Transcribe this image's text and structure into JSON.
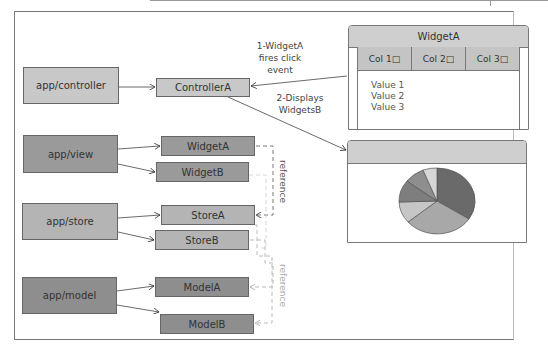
{
  "layers": [
    {
      "id": "controller",
      "label": "app/controller",
      "children": [
        "ControllerA"
      ]
    },
    {
      "id": "view",
      "label": "app/view",
      "children": [
        "WidgetA",
        "WidgetB"
      ]
    },
    {
      "id": "store",
      "label": "app/store",
      "children": [
        "StoreA",
        "StoreB"
      ]
    },
    {
      "id": "model",
      "label": "app/model",
      "children": [
        "ModelA",
        "ModelB"
      ]
    }
  ],
  "annotations": {
    "step1": [
      "1-WidgetA",
      "fires click",
      "event"
    ],
    "step2": [
      "2-Displays",
      "WidgetsB"
    ],
    "reference_1": "reference",
    "reference_2": "reference"
  },
  "widgetA_panel": {
    "title": "WidgetA",
    "columns": [
      "Col 1□",
      "Col 2□",
      "Col 3□"
    ],
    "values": [
      "Value 1",
      "Value 2",
      "Value 3"
    ]
  },
  "chart_panel": {
    "title": "",
    "pie_slices": [
      {
        "label": "slice-1",
        "pct": 33,
        "color": "#6a6a6a"
      },
      {
        "label": "slice-2",
        "pct": 28,
        "color": "#a8a8a8"
      },
      {
        "label": "slice-3",
        "pct": 12,
        "color": "#c6c6c6"
      },
      {
        "label": "slice-4",
        "pct": 11,
        "color": "#7e7e7e"
      },
      {
        "label": "slice-5",
        "pct": 9,
        "color": "#8e8e8e"
      },
      {
        "label": "slice-6",
        "pct": 7,
        "color": "#d6d6d6"
      }
    ]
  }
}
